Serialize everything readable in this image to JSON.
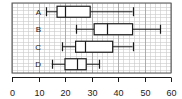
{
  "chart_data": {
    "type": "box",
    "title": "",
    "xlabel": "",
    "ylabel": "",
    "orientation": "horizontal",
    "grid": true,
    "grid_minor_step": 2,
    "grid_major_step": 10,
    "xlim": [
      0,
      60
    ],
    "xticks": [
      0,
      10,
      20,
      30,
      40,
      50,
      60
    ],
    "xtick_labels": [
      "0",
      "10",
      "20",
      "30",
      "40",
      "50",
      "60"
    ],
    "categories": [
      "A",
      "B",
      "C",
      "D"
    ],
    "boxes": [
      {
        "category": "A",
        "min": 13,
        "q1": 17,
        "median": 20,
        "q3": 29.5,
        "max": 45.5
      },
      {
        "category": "B",
        "min": 24,
        "q1": 31,
        "median": 36,
        "q3": 45.5,
        "max": 56
      },
      {
        "category": "C",
        "min": 19,
        "q1": 24,
        "median": 27.5,
        "q3": 38,
        "max": 45.5
      },
      {
        "category": "D",
        "min": 15,
        "q1": 20,
        "median": 24.5,
        "q3": 28,
        "max": 33
      }
    ],
    "colors": {
      "line": "#1a1a1a",
      "grid_minor": "#c9c9c9",
      "grid_major": "#9a9a9a",
      "frame": "#555555",
      "background": "#ffffff",
      "box_fill": "#ffffff"
    }
  }
}
